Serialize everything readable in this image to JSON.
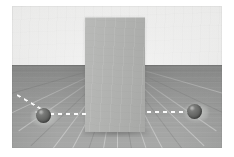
{
  "scene": {
    "title": "Physics simulation render",
    "description": "Third-person 3D render of a ball trajectory toward an occluding wall",
    "canvas": {
      "width": 234,
      "height": 157,
      "background_color": "#ffffff"
    },
    "viewport": {
      "left": 12,
      "top": 6,
      "width": 210,
      "height": 142
    },
    "horizon_y": 59
  },
  "background": {
    "name": "back-wall",
    "label": "Back wall",
    "color_top": "#f7f7f6",
    "color_bottom": "#ebebea"
  },
  "floor": {
    "name": "wood-floor",
    "label": "Wooden floor",
    "color_near": "#a8a9a8",
    "color_far": "#8d8e8d",
    "plank_count": 17,
    "vanishing_point": {
      "x": 105,
      "y": 57
    }
  },
  "objects": [
    {
      "name": "barrier",
      "label": "Occluding wall",
      "shape": "rectangle",
      "color": "#b3b4b2",
      "x": 73,
      "y": 11,
      "width": 60,
      "height": 115
    },
    {
      "name": "ball-left",
      "label": "Ball (near side)",
      "shape": "sphere",
      "color": "#5e5f5d",
      "center_x": 31,
      "center_y": 109,
      "radius": 7
    },
    {
      "name": "ball-right",
      "label": "Ball (far side)",
      "shape": "sphere",
      "color": "#5e5f5d",
      "center_x": 182,
      "center_y": 105,
      "radius": 7
    }
  ],
  "trajectory": {
    "name": "trajectory-path",
    "label": "Dashed trajectory",
    "color": "#fbfbfb",
    "style": "dashed",
    "segments": [
      {
        "name": "incoming-segment",
        "from_x": 5,
        "from_y": 88,
        "to_x": 34,
        "to_y": 105,
        "angle_deg": 30
      },
      {
        "name": "left-segment",
        "from_x": 38,
        "from_y": 107,
        "to_x": 76,
        "to_y": 107,
        "angle_deg": 0
      },
      {
        "name": "right-segment",
        "from_x": 135,
        "from_y": 105,
        "to_x": 177,
        "to_y": 105,
        "angle_deg": 0
      }
    ],
    "burst": {
      "name": "impact-burst",
      "origin_x": 31,
      "origin_y": 116,
      "ray_angles_deg": [
        -62,
        -34,
        -8,
        16,
        44
      ]
    }
  }
}
